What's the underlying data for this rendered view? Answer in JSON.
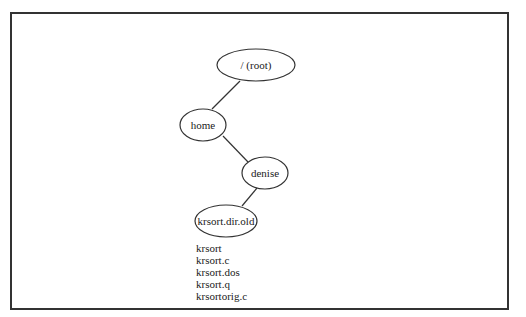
{
  "diagram": {
    "type": "directory-tree",
    "nodes": [
      {
        "id": "root",
        "label": "/ (root)",
        "cx": 256,
        "cy": 65,
        "rx": 39,
        "ry": 16
      },
      {
        "id": "home",
        "label": "home",
        "cx": 203,
        "cy": 125,
        "rx": 23,
        "ry": 16
      },
      {
        "id": "denise",
        "label": "denise",
        "cx": 265,
        "cy": 173,
        "rx": 23,
        "ry": 16
      },
      {
        "id": "krsort_dir_old",
        "label": "krsort.dir.old",
        "cx": 226,
        "cy": 221,
        "rx": 31,
        "ry": 16
      }
    ],
    "edges": [
      {
        "from": "root",
        "to": "home"
      },
      {
        "from": "home",
        "to": "denise"
      },
      {
        "from": "denise",
        "to": "krsort_dir_old"
      }
    ],
    "files": [
      "krsort",
      "krsort.c",
      "krsort.dos",
      "krsort.q",
      "krsortorig.c"
    ],
    "colors": {
      "stroke": "#333333",
      "text": "#1a1a1a",
      "background": "#ffffff"
    }
  }
}
